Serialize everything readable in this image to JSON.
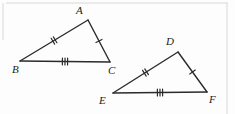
{
  "figure": {
    "background_color": "#fdfdfd",
    "stroke_color": "#2b2b2b",
    "frame_color": "#d8d8d8",
    "label_color": "#1c1c1c"
  },
  "triangles": [
    {
      "name": "triangle-abc",
      "vertices": [
        {
          "label": "A",
          "x": 88,
          "y": 20,
          "label_x": 76,
          "label_y": 5
        },
        {
          "label": "B",
          "x": 20,
          "y": 61,
          "label_x": 12,
          "label_y": 64
        },
        {
          "label": "C",
          "x": 110,
          "y": 62,
          "label_x": 108,
          "label_y": 65
        }
      ],
      "sides": [
        {
          "name": "side-ab",
          "from": "B",
          "to": "A",
          "ticks": 2
        },
        {
          "name": "side-ac",
          "from": "A",
          "to": "C",
          "ticks": 1
        },
        {
          "name": "side-bc",
          "from": "B",
          "to": "C",
          "ticks": 3
        }
      ]
    },
    {
      "name": "triangle-def",
      "vertices": [
        {
          "label": "D",
          "x": 178,
          "y": 52,
          "label_x": 166,
          "label_y": 36
        },
        {
          "label": "E",
          "x": 113,
          "y": 93,
          "label_x": 99,
          "label_y": 95
        },
        {
          "label": "F",
          "x": 207,
          "y": 92,
          "label_x": 209,
          "label_y": 94
        }
      ],
      "sides": [
        {
          "name": "side-ed",
          "from": "E",
          "to": "D",
          "ticks": 2
        },
        {
          "name": "side-df",
          "from": "D",
          "to": "F",
          "ticks": 1
        },
        {
          "name": "side-ef",
          "from": "E",
          "to": "F",
          "ticks": 3
        }
      ]
    }
  ],
  "frame": {
    "top_rule": {
      "x1": 6,
      "y1": 3,
      "x2": 228,
      "y2": 3
    },
    "left_rule": {
      "x1": 3,
      "y1": 3,
      "x2": 3,
      "y2": 40
    },
    "right_rule": {
      "x1": 227,
      "y1": 3,
      "x2": 227,
      "y2": 114
    }
  }
}
